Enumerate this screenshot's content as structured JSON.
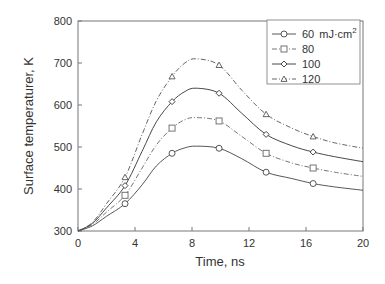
{
  "chart_data": {
    "type": "line",
    "title": "",
    "xlabel": "Time, ns",
    "ylabel": "Surface temperaturer, K",
    "xlim": [
      0,
      20
    ],
    "ylim": [
      300,
      800
    ],
    "xticks": [
      "0",
      "4",
      "8",
      "12",
      "16",
      "20"
    ],
    "yticks": [
      "300",
      "400",
      "500",
      "600",
      "700",
      "800"
    ],
    "grid": false,
    "legend_position": "upper right",
    "legend_unit": "mJ·cm⁻²",
    "series": [
      {
        "name": "60 mJ·cm⁻²",
        "legend_label": "60",
        "marker": "circle",
        "style": "solid",
        "color": "#444444",
        "x": [
          0,
          1,
          2,
          3.3,
          4.5,
          5.5,
          6.6,
          7.5,
          8.3,
          9.9,
          11.5,
          13.2,
          15,
          16.5,
          18,
          20
        ],
        "y": [
          300,
          312,
          335,
          365,
          410,
          455,
          485,
          498,
          502,
          497,
          472,
          440,
          425,
          413,
          405,
          397
        ],
        "markers_x": [
          3.3,
          6.6,
          9.9,
          13.2,
          16.5
        ],
        "markers_y": [
          365,
          485,
          497,
          440,
          413
        ]
      },
      {
        "name": "80",
        "legend_label": "80",
        "marker": "square",
        "style": "dash-dot",
        "color": "#666666",
        "x": [
          0,
          1,
          2,
          3.3,
          4.5,
          5.5,
          6.6,
          7.5,
          8.3,
          9.9,
          11.5,
          13.2,
          15,
          16.5,
          18,
          20
        ],
        "y": [
          300,
          315,
          345,
          385,
          450,
          505,
          545,
          565,
          570,
          562,
          525,
          485,
          462,
          450,
          440,
          430
        ],
        "markers_x": [
          3.3,
          6.6,
          9.9,
          13.2,
          16.5
        ],
        "markers_y": [
          385,
          545,
          562,
          485,
          450
        ]
      },
      {
        "name": "100",
        "legend_label": "100",
        "marker": "diamond",
        "style": "solid",
        "color": "#333333",
        "x": [
          0,
          1,
          2,
          3.3,
          4.5,
          5.5,
          6.6,
          7.5,
          8.3,
          9.9,
          11.5,
          13.2,
          15,
          16.5,
          18,
          20
        ],
        "y": [
          300,
          318,
          355,
          408,
          490,
          560,
          608,
          632,
          640,
          628,
          580,
          530,
          503,
          488,
          477,
          465
        ],
        "markers_x": [
          3.3,
          6.6,
          9.9,
          13.2,
          16.5
        ],
        "markers_y": [
          408,
          608,
          628,
          530,
          488
        ]
      },
      {
        "name": "120",
        "legend_label": "120",
        "marker": "triangle",
        "style": "dash-dot",
        "color": "#555555",
        "x": [
          0,
          1,
          2,
          3.3,
          4.5,
          5.5,
          6.6,
          7.5,
          8.3,
          9.9,
          11.5,
          13.2,
          15,
          16.5,
          18,
          20
        ],
        "y": [
          300,
          320,
          365,
          428,
          530,
          610,
          668,
          700,
          710,
          695,
          635,
          578,
          545,
          525,
          510,
          497
        ],
        "markers_x": [
          3.3,
          6.6,
          9.9,
          13.2,
          16.5
        ],
        "markers_y": [
          428,
          668,
          695,
          578,
          525
        ]
      }
    ]
  },
  "legend": {
    "entries": [
      {
        "label": "60",
        "unit": "mJ·cm",
        "sup": "2"
      },
      {
        "label": "80"
      },
      {
        "label": "100"
      },
      {
        "label": "120"
      }
    ]
  },
  "axes": {
    "xlabel": "Time, ns",
    "ylabel": "Surface temperaturer, K"
  }
}
